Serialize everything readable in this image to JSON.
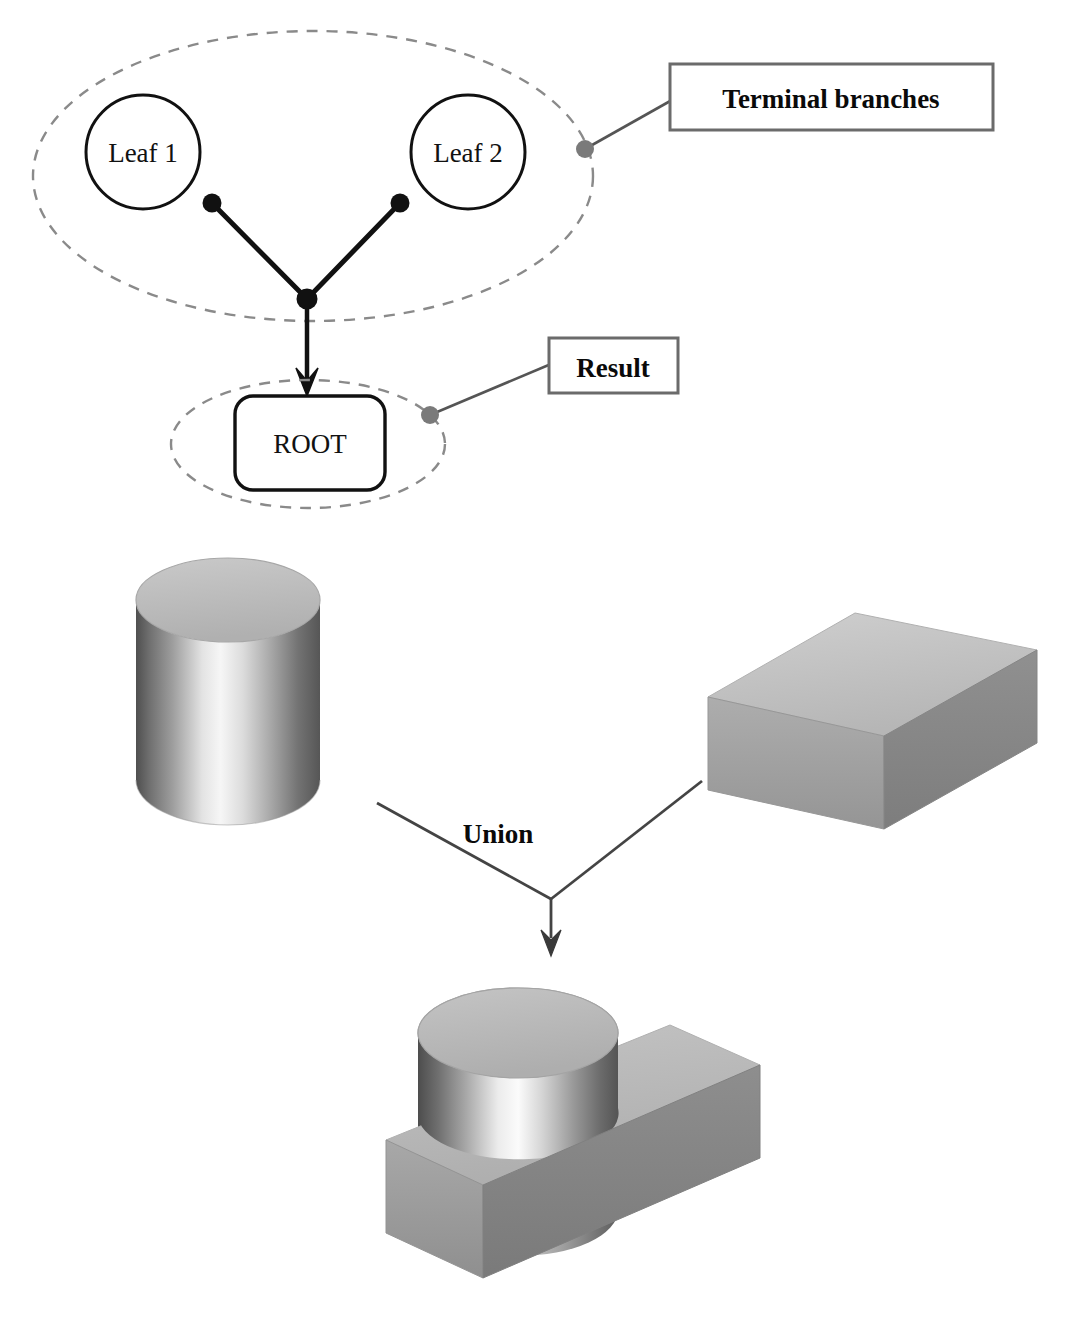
{
  "diagram": {
    "title_visible": false,
    "background_color": "#ffffff",
    "tree": {
      "group_label": "terminal-branch-group",
      "leaves": [
        {
          "label": "Leaf 1",
          "cx": 143,
          "cy": 152,
          "r": 57,
          "dot_x": 212,
          "dot_y": 203
        },
        {
          "label": "Leaf 2",
          "cx": 468,
          "cy": 152,
          "r": 57,
          "dot_x": 400,
          "dot_y": 203
        }
      ],
      "junction": {
        "x": 307,
        "y": 299
      },
      "root": {
        "label": "ROOT",
        "x": 235,
        "y": 396,
        "width": 150,
        "height": 94,
        "radius": 18
      },
      "arrow": {
        "from_x": 307,
        "from_y": 299,
        "to_x": 307,
        "to_y": 396
      },
      "group_ellipse": {
        "cx": 313,
        "cy": 176,
        "rx": 280,
        "ry": 145
      },
      "root_ellipse": {
        "cx": 308,
        "cy": 444,
        "rx": 137,
        "ry": 64
      }
    },
    "callouts": [
      {
        "name": "terminal-branches",
        "text": "Terminal branches",
        "box": {
          "x": 670,
          "y": 64,
          "width": 323,
          "height": 66
        },
        "anchor_dot": {
          "x": 585,
          "y": 149
        },
        "leader": {
          "x1": 585,
          "y1": 149,
          "x2": 670,
          "y2": 100
        }
      },
      {
        "name": "result",
        "text": "Result",
        "box": {
          "x": 549,
          "y": 338,
          "width": 129,
          "height": 55
        },
        "anchor_dot": {
          "x": 430,
          "y": 415
        },
        "leader": {
          "x1": 430,
          "y1": 415,
          "x2": 549,
          "y2": 365
        }
      }
    ],
    "operation": {
      "label": "Union",
      "label_x": 500,
      "label_y": 833,
      "left_arm": {
        "x1": 377,
        "y1": 803,
        "x2": 551,
        "y2": 899
      },
      "right_arm": {
        "x1": 551,
        "y1": 899,
        "x2": 700,
        "y2": 783
      },
      "down_arrow": {
        "x1": 551,
        "y1": 899,
        "x2": 551,
        "y2": 950
      }
    },
    "solids": [
      {
        "name": "operand-cylinder",
        "kind": "cylinder",
        "top_ellipse": {
          "cx": 228,
          "cy": 600,
          "rx": 92,
          "ry": 42
        },
        "height": 222,
        "top_color": "#b8b8b8",
        "side_dark": "#5a5a5a",
        "side_light": "#f2f2f2"
      },
      {
        "name": "operand-block",
        "kind": "box",
        "top_color": "#c2c2c2",
        "front_color": "#a0a0a0",
        "side_color": "#8a8a8a",
        "corners": {
          "top_left": [
            708,
            697
          ],
          "top_back": [
            855,
            613
          ],
          "top_right": [
            1037,
            650
          ],
          "top_front": [
            884,
            736
          ]
        },
        "depth": 93
      },
      {
        "name": "union-result",
        "kind": "cylinder-box-union",
        "cylinder": {
          "cx": 518,
          "cy": 1033,
          "rx": 100,
          "ry": 45,
          "height": 200
        },
        "block_corners": {
          "top_left": [
            386,
            1140
          ],
          "top_back": [
            670,
            1025
          ],
          "top_right": [
            760,
            1065
          ],
          "top_front": [
            483,
            1185
          ]
        },
        "block_depth": 93,
        "top_color": "#b5b5b5",
        "front_color": "#9e9e9e",
        "side_color": "#888888"
      }
    ],
    "colors": {
      "ink": "#111111",
      "dashed_outline": "#8a8a8a",
      "callout_border": "#6b6b6b",
      "marker_dot": "#7a7a7a",
      "leader_line": "#555555"
    }
  }
}
